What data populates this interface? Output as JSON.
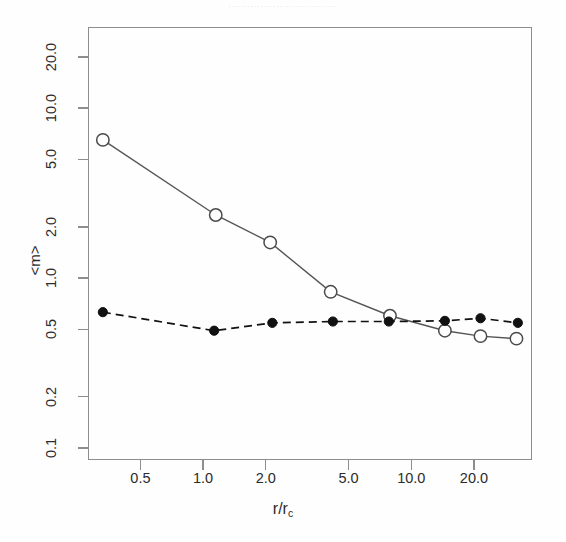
{
  "figure": {
    "caption_remnant": "..................................",
    "axis_title_y": "<m>",
    "axis_title_x_main": "r/r",
    "axis_title_x_sub": "c"
  },
  "chart_data": {
    "type": "line",
    "title": "",
    "xlabel": "r/r_c",
    "ylabel": "<m>",
    "xscale": "log",
    "yscale": "log",
    "xlim": [
      0.28,
      38
    ],
    "ylim": [
      0.085,
      30
    ],
    "grid": false,
    "legend": "none",
    "xticks": [
      "0.5",
      "1.0",
      "2.0",
      "5.0",
      "10.0",
      "20.0"
    ],
    "xtick_values": [
      0.5,
      1.0,
      2.0,
      5.0,
      10.0,
      20.0
    ],
    "yticks": [
      "20.0",
      "10.0",
      "5.0",
      "2.0",
      "1.0",
      "0.5",
      "0.2",
      "0.1"
    ],
    "ytick_values": [
      20.0,
      10.0,
      5.0,
      2.0,
      1.0,
      0.5,
      0.2,
      0.1
    ],
    "series": [
      {
        "name": "open-circles-solid",
        "marker": "open-circle",
        "linestyle": "solid",
        "color": "#555555",
        "x": [
          0.33,
          1.15,
          2.1,
          4.1,
          7.9,
          14.5,
          21.5,
          32.0
        ],
        "y": [
          6.5,
          2.35,
          1.62,
          0.83,
          0.6,
          0.49,
          0.455,
          0.44
        ]
      },
      {
        "name": "filled-circles-dashed",
        "marker": "filled-circle",
        "linestyle": "dashed",
        "color": "#111111",
        "x": [
          0.33,
          1.13,
          2.15,
          4.2,
          7.8,
          14.5,
          21.5,
          32.5
        ],
        "y": [
          0.63,
          0.49,
          0.545,
          0.555,
          0.555,
          0.56,
          0.58,
          0.545
        ]
      }
    ]
  },
  "colors": {
    "axis": "#8d8d8f",
    "solid_line": "#555555",
    "dashed_line": "#111111",
    "text": "#2b2b2b",
    "background": "#fefefe"
  }
}
